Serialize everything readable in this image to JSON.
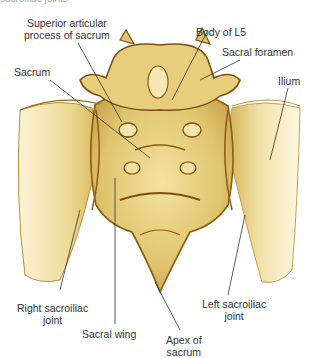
{
  "figure": {
    "caption_cutoff": "sacroiliac joints",
    "colors": {
      "bone_light": "#f3e3a8",
      "bone_mid": "#dcc06a",
      "bone_dark": "#9a6a1a",
      "outline": "#7a4f10",
      "leader_line": "#333333",
      "label_text": "#333333"
    },
    "labels": [
      {
        "id": "superior-articular-process",
        "line1": "Superior articular",
        "line2": "process of sacrum"
      },
      {
        "id": "body-of-l5",
        "line1": "Body of L5"
      },
      {
        "id": "sacral-foramen",
        "line1": "Sacral foramen"
      },
      {
        "id": "sacrum",
        "line1": "Sacrum"
      },
      {
        "id": "ilium",
        "line1": "Ilium"
      },
      {
        "id": "right-sacroiliac-joint",
        "line1": "Right sacroiliac",
        "line2": "joint"
      },
      {
        "id": "sacral-wing",
        "line1": "Sacral wing"
      },
      {
        "id": "apex-of-sacrum",
        "line1": "Apex of",
        "line2": "sacrum"
      },
      {
        "id": "left-sacroiliac-joint",
        "line1": "Left sacroiliac",
        "line2": "joint"
      }
    ]
  }
}
